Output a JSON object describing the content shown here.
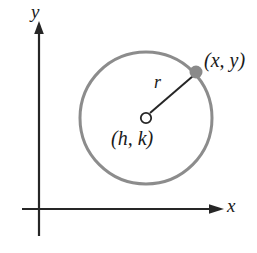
{
  "figure": {
    "background_color": "#ffffff"
  },
  "axes": {
    "x_axis_label": "x",
    "y_axis_label": "y",
    "axis_color": "#262626",
    "origin": {
      "x": 39,
      "y": 209
    },
    "x_axis": {
      "from_x": 22,
      "to_x": 224,
      "y": 209,
      "arrow": "right"
    },
    "y_axis": {
      "x": 39,
      "from_y": 236,
      "to_y": 22,
      "arrow": "up"
    }
  },
  "circle": {
    "center": {
      "x": 146,
      "y": 118
    },
    "radius": 66,
    "stroke_color": "#8c8c8c",
    "stroke_width": 3
  },
  "center_marker": {
    "label": "(h, k)",
    "shape": "open-circle",
    "fill_color": "#ffffff",
    "stroke_color": "#262626",
    "radius": 5
  },
  "point_marker": {
    "label": "(x, y)",
    "shape": "filled-circle",
    "fill_color": "#8a8a8a",
    "radius": 6,
    "position": {
      "x": 196,
      "y": 72
    }
  },
  "radius_segment": {
    "label": "r",
    "stroke_color": "#262626",
    "stroke_width": 2,
    "from": {
      "x": 149,
      "y": 113
    },
    "to": {
      "x": 193,
      "y": 75
    }
  }
}
